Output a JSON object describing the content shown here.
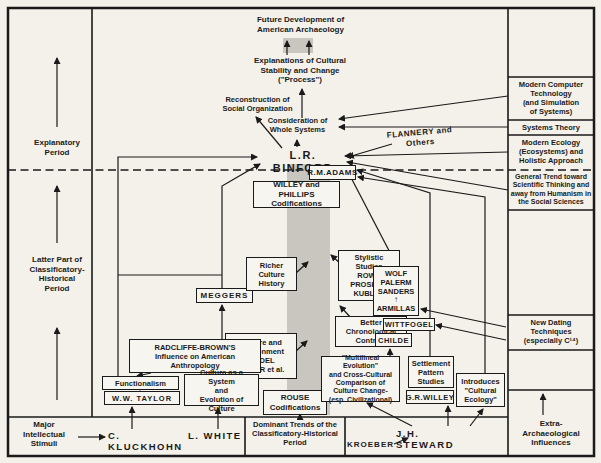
{
  "colors": {
    "background": "#f4f1ea",
    "line": "#1a1a1a",
    "band": "#c9c6bf"
  },
  "icons": {
    "arrow_up": "↑"
  },
  "left_column": {
    "explanatory_period": "Explanatory\nPeriod",
    "latter_part": "Latter Part of\nClassificatory-\nHistorical\nPeriod"
  },
  "right_column": {
    "modern_computer": "Modern Computer\nTechnology\n(and Simulation\nof Systems)",
    "systems_theory": "Systems Theory",
    "modern_ecology": "Modern Ecology\n(Ecosystems) and\nHolistic Approach",
    "general_trend": "General Trend toward\nScientific Thinking and\naway from Humanism in\nthe Social Sciences",
    "new_dating": "New Dating\nTechniques\n(especially C¹⁴)",
    "extra_arch": "Extra-\nArchaeological\nInfluences"
  },
  "bottom": {
    "major_stimuli": "Major\nIntellectual\nStimuli",
    "kluckhohn": "C. KLUCKHOHN",
    "white": "L. WHITE",
    "dominant_trends": "Dominant Trends of the\nClassificatory-Historical\nPeriod",
    "kroeber": "KROEBER",
    "steward": "J.H. STEWARD"
  },
  "center": {
    "future": "Future Development of\nAmerican Archaeology",
    "explanations": "Explanations of Cultural\nStability and Change\n(\"Process\")",
    "reconstruction": "Reconstruction of\nSocial Organization",
    "whole_systems": "Consideration of\nWhole Systems",
    "binford": "L.R. BINFORD",
    "flannery": "FLANNERY and Others",
    "adams": "R.M.ADAMS",
    "willey_phillips": "WILLEY and PHILLIPS\nCodifications",
    "rouse": "ROUSE\nCodifications"
  },
  "boxes": {
    "richer": "Richer\nCulture\nHistory",
    "stylistic": "Stylistic\nStudies\nROWE\nPROSK'FF\nKUBLER",
    "meggers": "MEGGERS",
    "better_chron": "Better\nChronological\nControls",
    "culture_env": "Culture and\nEnvironment\nWEDEL\nHEIZER et al.",
    "radcliffe": "RADCLIFFE-BROWN'S\nInfluence on American\nAnthropology",
    "functionalism": "Functionalism",
    "taylor": "W.W. TAYLOR",
    "culture_system": "Culture as a System\nand\nEvolution of Culture",
    "wolf": "WOLF\nPALERM\nSANDERS",
    "armillas": "ARMILLAS",
    "wittfogel": "WITTFOGEL",
    "childe": "CHILDE",
    "multilineal": "\"Multilineal Evolution\"\nand Cross-Cultural\nComparison of\nCulture Change-\n(esp. Civilizational)",
    "settlement": "Settlement\nPattern\nStudies",
    "gr_willey": "G.R.WILLEY",
    "cultural_ecology": "Introduces\n\"Cultural\nEcology\""
  }
}
